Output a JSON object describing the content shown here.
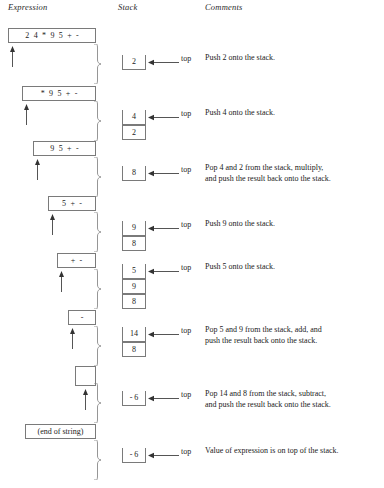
{
  "figure": {
    "expression": "2 4 * 9 5 + -",
    "result": "-6",
    "colors": {
      "line": "#7a7a7a",
      "text": "#1a1a1a",
      "background": "#ffffff"
    }
  },
  "headers": {
    "expression": "Expression",
    "stack": "Stack",
    "comments": "Comments"
  },
  "labels": {
    "top": "top",
    "end_of_string": "(end of string)"
  },
  "rows": [
    {
      "expr_tokens": [
        "2",
        "4",
        "*",
        "9",
        "5",
        "+",
        "-"
      ],
      "expr_text": "2 4 * 9 5 + -",
      "stack": [],
      "comment_lines": []
    },
    {
      "expr_tokens": [
        "*",
        "9",
        "5",
        "+",
        "-"
      ],
      "expr_text": "* 9 5 + -",
      "stack": [
        "2"
      ],
      "comment_lines": [
        "Push 2 onto the stack."
      ]
    },
    {
      "expr_tokens": [
        "9",
        "5",
        "+",
        "-"
      ],
      "expr_text": "9 5 + -",
      "stack": [
        "4",
        "2"
      ],
      "comment_lines": [
        "Push 4 onto the stack."
      ]
    },
    {
      "expr_tokens": [
        "5",
        "+",
        "-"
      ],
      "expr_text": "5 + -",
      "stack": [
        "8"
      ],
      "comment_lines": [
        "Pop 4 and 2 from the stack, multiply,",
        "and push the result back onto the stack."
      ]
    },
    {
      "expr_tokens": [
        "+",
        "-"
      ],
      "expr_text": "+ -",
      "stack": [
        "9",
        "8"
      ],
      "comment_lines": [
        "Push 9 onto the stack."
      ]
    },
    {
      "expr_tokens": [
        "-"
      ],
      "expr_text": "-",
      "stack": [
        "5",
        "9",
        "8"
      ],
      "comment_lines": [
        "Push 5 onto the stack."
      ]
    },
    {
      "expr_tokens": [],
      "expr_text": "",
      "stack": [
        "14",
        "8"
      ],
      "comment_lines": [
        "Pop 5 and 9 from the stack, add, and",
        "push the result back onto the stack."
      ]
    },
    {
      "expr_tokens": [
        "(end of string)"
      ],
      "expr_text": "(end of string)",
      "stack": [
        "- 6"
      ],
      "comment_lines": [
        "Pop 14 and 8 from the stack, subtract,",
        "and push the result back onto the stack."
      ]
    },
    {
      "expr_tokens": [],
      "expr_text": "",
      "stack": [
        "- 6"
      ],
      "comment_lines": [
        "Value of expression is on top of the stack."
      ]
    }
  ]
}
